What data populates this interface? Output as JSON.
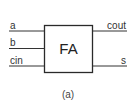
{
  "diagram": {
    "block": {
      "label": "FA"
    },
    "inputs": [
      {
        "label": "a"
      },
      {
        "label": "b"
      },
      {
        "label": "cin"
      }
    ],
    "outputs": [
      {
        "label": "cout"
      },
      {
        "label": "s"
      }
    ],
    "caption": "(a)",
    "colors": {
      "line": "#333333",
      "box_fill": "#ffffff"
    }
  }
}
